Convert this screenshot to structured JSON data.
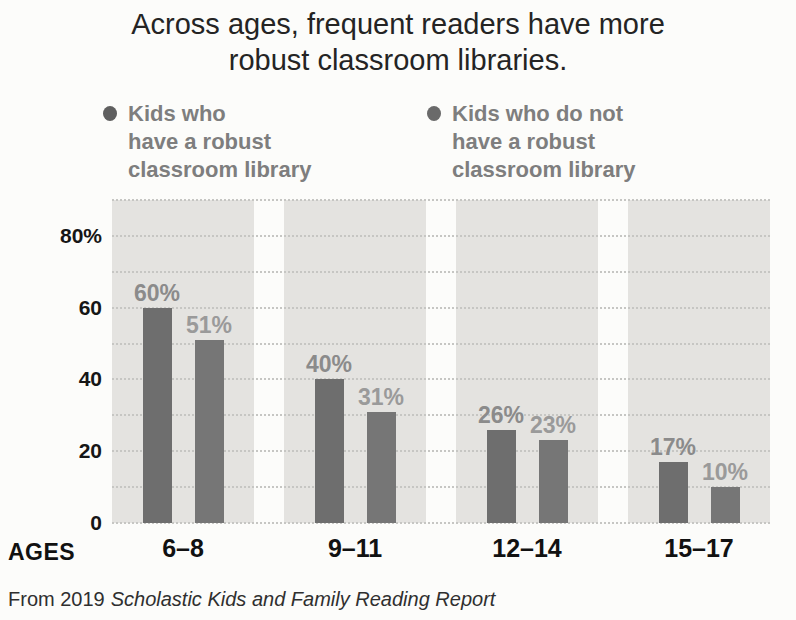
{
  "header": {
    "title_line1": "Across ages, frequent readers have more",
    "title_line2": "robust classroom libraries."
  },
  "legend": {
    "items": [
      {
        "label": "Kids who have a robust classroom library",
        "lines": [
          "Kids who",
          "have a robust",
          "classroom library"
        ],
        "dot_color": "#5f5f5f"
      },
      {
        "label": "Kids who do not have a robust classroom library",
        "lines": [
          "Kids who do not",
          "have a robust",
          "classroom library"
        ],
        "dot_color": "#6a6a6a"
      }
    ]
  },
  "source": {
    "prefix": "From 2019",
    "work_title": "Scholastic Kids and Family Reading Report"
  },
  "colors": {
    "page_background": "#fcfcfa",
    "band_background": "#e4e3e0",
    "gridline": "#c6c6c3",
    "title_text": "#242424",
    "legend_text": "#7e7e7e",
    "axis_text": "#161616"
  },
  "chart_data": {
    "type": "bar",
    "title": "Across ages, frequent readers have more robust classroom libraries.",
    "categories": [
      "6–8",
      "9–11",
      "12–14",
      "15–17"
    ],
    "series": [
      {
        "name": "Kids who have a robust classroom library",
        "values": [
          60,
          40,
          26,
          17
        ],
        "bar_color": "#6e6e6e",
        "label_color": "#8b8b8b"
      },
      {
        "name": "Kids who do not have a robust classroom library",
        "values": [
          51,
          31,
          23,
          10
        ],
        "bar_color": "#767676",
        "label_color": "#9a9a9a"
      }
    ],
    "value_suffix": "%",
    "xlabel": "AGES",
    "ylabel": "",
    "ylim": [
      0,
      90
    ],
    "gridline_step": 10,
    "grid": "dotted",
    "legend_position": "top",
    "ytick_values": [
      0,
      20,
      40,
      60,
      80
    ],
    "ytick_labels": [
      "0",
      "20",
      "40",
      "60",
      "80%"
    ]
  }
}
